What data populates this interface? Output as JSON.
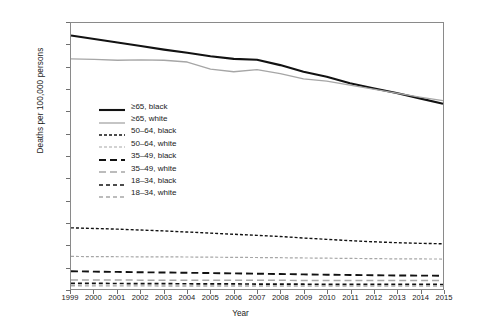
{
  "chart_data": {
    "type": "line",
    "title": "",
    "xlabel": "Year",
    "ylabel": "Deaths per 100,000 persons",
    "x": [
      1999,
      2000,
      2001,
      2002,
      2003,
      2004,
      2005,
      2006,
      2007,
      2008,
      2009,
      2010,
      2011,
      2012,
      2013,
      2014,
      2015
    ],
    "xlim": [
      1999,
      2015
    ],
    "ylim": [
      0,
      6000
    ],
    "yticks": [
      "0",
      "500",
      "1,000",
      "1,500",
      "2,000",
      "2,500",
      "3,000",
      "3,500",
      "4,000",
      "4,500",
      "5,000",
      "5,500",
      "6,000"
    ],
    "xticks": [
      "1999",
      "2000",
      "2001",
      "2002",
      "2003",
      "2004",
      "2005",
      "2006",
      "2007",
      "2008",
      "2009",
      "2010",
      "2011",
      "2012",
      "2013",
      "2014",
      "2015"
    ],
    "grid": false,
    "legend_position": "inside-upper-left",
    "series": [
      {
        "name": "≥65, black",
        "color": "#121212",
        "width": 2.1,
        "dash": "none",
        "values": [
          5720,
          5640,
          5560,
          5480,
          5400,
          5330,
          5250,
          5190,
          5170,
          5050,
          4900,
          4790,
          4640,
          4530,
          4420,
          4300,
          4180
        ]
      },
      {
        "name": "≥65, white",
        "color": "#a6a6a6",
        "width": 1.3,
        "dash": "none",
        "values": [
          5190,
          5180,
          5160,
          5170,
          5160,
          5120,
          4960,
          4900,
          4950,
          4860,
          4740,
          4690,
          4600,
          4510,
          4420,
          4330,
          4250
        ]
      },
      {
        "name": "50–64, black",
        "color": "#121212",
        "width": 1.4,
        "dash": "3,2",
        "values": [
          1380,
          1365,
          1350,
          1330,
          1310,
          1285,
          1260,
          1235,
          1210,
          1185,
          1150,
          1120,
          1090,
          1065,
          1045,
          1030,
          1020
        ]
      },
      {
        "name": "50–64, white",
        "color": "#a6a6a6",
        "width": 1.2,
        "dash": "3,2",
        "values": [
          735,
          730,
          728,
          726,
          724,
          722,
          718,
          714,
          710,
          706,
          700,
          695,
          690,
          685,
          680,
          678,
          676
        ]
      },
      {
        "name": "35–49, black",
        "color": "#121212",
        "width": 1.9,
        "dash": "7,4",
        "values": [
          400,
          392,
          385,
          378,
          372,
          366,
          360,
          352,
          345,
          338,
          330,
          322,
          316,
          310,
          305,
          302,
          300
        ]
      },
      {
        "name": "35–49, white",
        "color": "#a6a6a6",
        "width": 1.5,
        "dash": "7,4",
        "values": [
          205,
          203,
          201,
          200,
          199,
          198,
          197,
          196,
          196,
          195,
          194,
          193,
          192,
          192,
          191,
          191,
          190
        ]
      },
      {
        "name": "18–34, black",
        "color": "#121212",
        "width": 1.7,
        "dash": "4,3",
        "values": [
          128,
          126,
          124,
          122,
          120,
          118,
          116,
          114,
          112,
          110,
          108,
          106,
          105,
          104,
          103,
          103,
          102
        ]
      },
      {
        "name": "18–34, white",
        "color": "#a6a6a6",
        "width": 1.4,
        "dash": "4,3",
        "values": [
          72,
          71,
          70,
          70,
          69,
          69,
          68,
          68,
          68,
          67,
          67,
          67,
          66,
          66,
          66,
          66,
          66
        ]
      }
    ]
  }
}
